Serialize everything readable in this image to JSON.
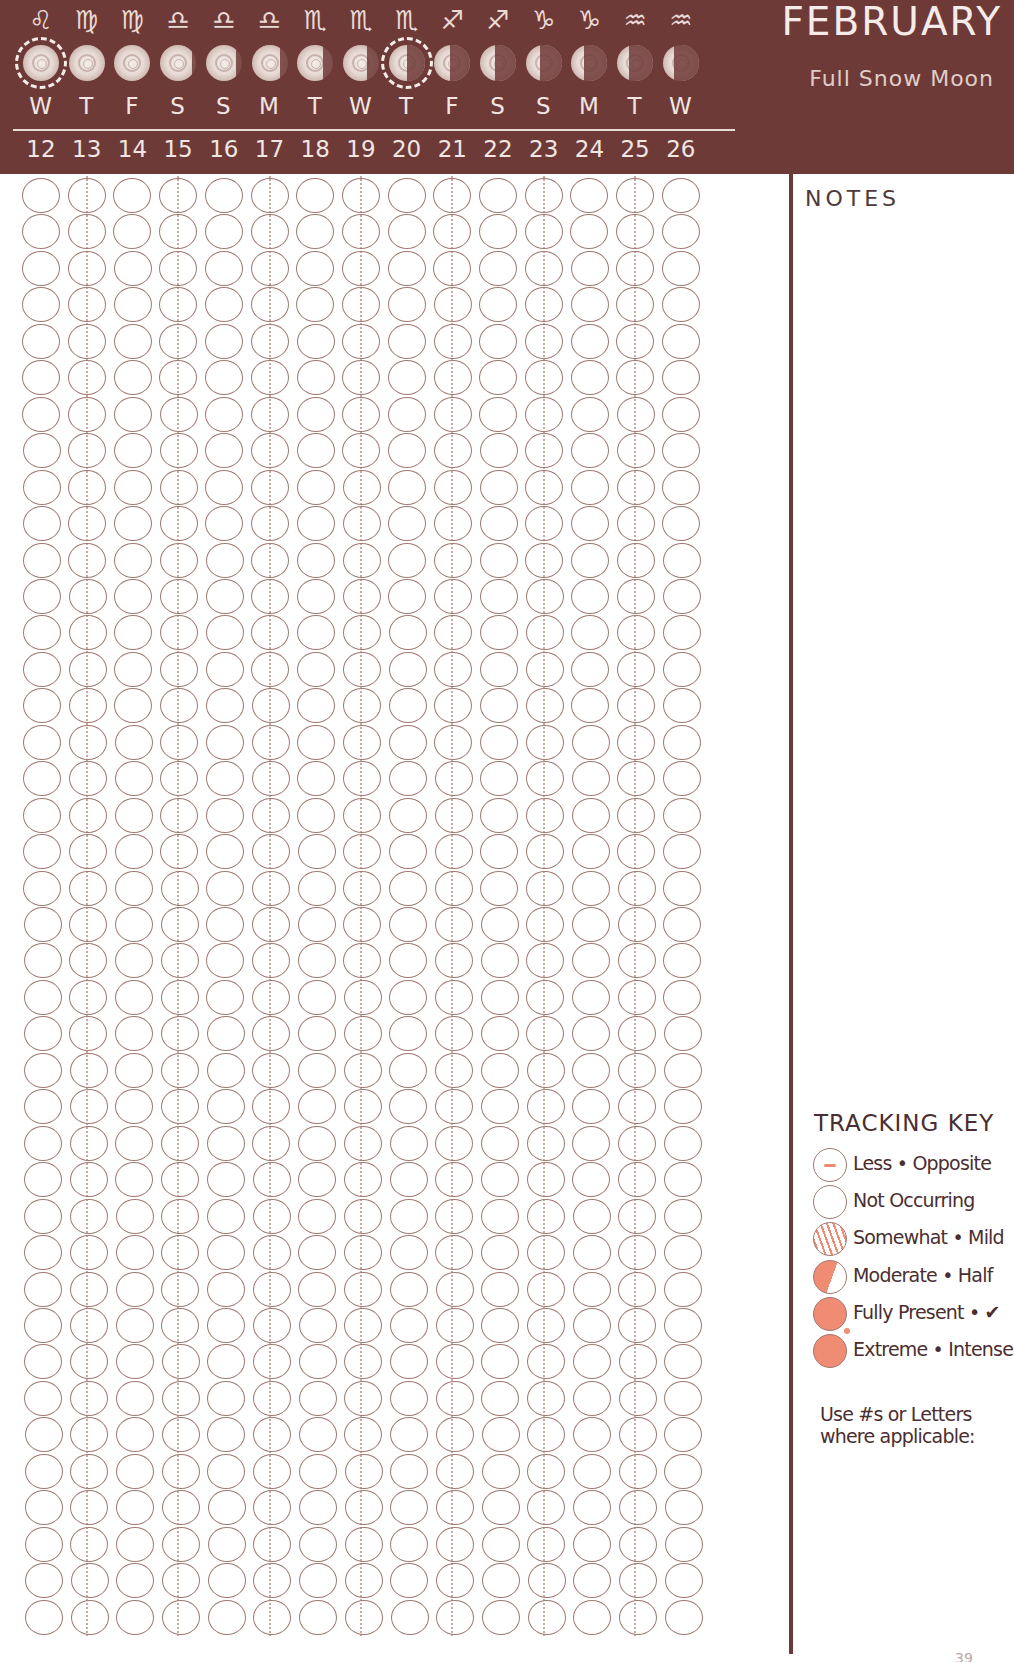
{
  "header": {
    "month": "FEBRUARY",
    "moon_name": "Full Snow Moon",
    "background_color": "#6e3a38"
  },
  "days": [
    {
      "zodiac": "♌",
      "zodiac_name": "Leo",
      "moon": "full",
      "highlighted": true,
      "weekday": "W",
      "date": "12"
    },
    {
      "zodiac": "♍",
      "zodiac_name": "Virgo",
      "moon": "full",
      "highlighted": false,
      "weekday": "T",
      "date": "13"
    },
    {
      "zodiac": "♍",
      "zodiac_name": "Virgo",
      "moon": "full",
      "highlighted": false,
      "weekday": "F",
      "date": "14"
    },
    {
      "zodiac": "♎",
      "zodiac_name": "Libra",
      "moon": "waning-gibbous",
      "highlighted": false,
      "weekday": "S",
      "date": "15"
    },
    {
      "zodiac": "♎",
      "zodiac_name": "Libra",
      "moon": "waning-gibbous",
      "highlighted": false,
      "weekday": "S",
      "date": "16"
    },
    {
      "zodiac": "♎",
      "zodiac_name": "Libra",
      "moon": "waning-gibbous",
      "highlighted": false,
      "weekday": "M",
      "date": "17"
    },
    {
      "zodiac": "♏",
      "zodiac_name": "Scorpio",
      "moon": "waning-gibbous",
      "highlighted": false,
      "weekday": "T",
      "date": "18"
    },
    {
      "zodiac": "♏",
      "zodiac_name": "Scorpio",
      "moon": "waning-gibbous",
      "highlighted": false,
      "weekday": "W",
      "date": "19"
    },
    {
      "zodiac": "♏",
      "zodiac_name": "Scorpio",
      "moon": "last-quarter",
      "highlighted": true,
      "weekday": "T",
      "date": "20"
    },
    {
      "zodiac": "♐",
      "zodiac_name": "Sagittarius",
      "moon": "waning-crescent",
      "highlighted": false,
      "weekday": "F",
      "date": "21"
    },
    {
      "zodiac": "♐",
      "zodiac_name": "Sagittarius",
      "moon": "waning-crescent",
      "highlighted": false,
      "weekday": "S",
      "date": "22"
    },
    {
      "zodiac": "♑",
      "zodiac_name": "Capricorn",
      "moon": "waning-crescent",
      "highlighted": false,
      "weekday": "S",
      "date": "23"
    },
    {
      "zodiac": "♑",
      "zodiac_name": "Capricorn",
      "moon": "waning-crescent",
      "highlighted": false,
      "weekday": "M",
      "date": "24"
    },
    {
      "zodiac": "♒",
      "zodiac_name": "Aquarius",
      "moon": "waning-crescent",
      "highlighted": false,
      "weekday": "T",
      "date": "25"
    },
    {
      "zodiac": "♒",
      "zodiac_name": "Aquarius",
      "moon": "waning-crescent",
      "highlighted": false,
      "weekday": "W",
      "date": "26"
    }
  ],
  "tracker": {
    "rows": 40,
    "columns": 15,
    "circle_color": "#9e7a72"
  },
  "notes": {
    "title": "NOTES"
  },
  "tracking_key": {
    "title": "TRACKING KEY",
    "accent_color": "#f08c73",
    "items": [
      {
        "style": "less",
        "label": "Less • Opposite"
      },
      {
        "style": "none",
        "label": "Not Occurring"
      },
      {
        "style": "mild",
        "label": "Somewhat • Mild"
      },
      {
        "style": "half",
        "label": "Moderate • Half"
      },
      {
        "style": "full",
        "label": "Fully Present • ✔"
      },
      {
        "style": "extreme",
        "label": "Extreme • Intense"
      }
    ],
    "note": "Use #s or Letters where applicable:"
  },
  "footer": {
    "page_number": "39"
  }
}
